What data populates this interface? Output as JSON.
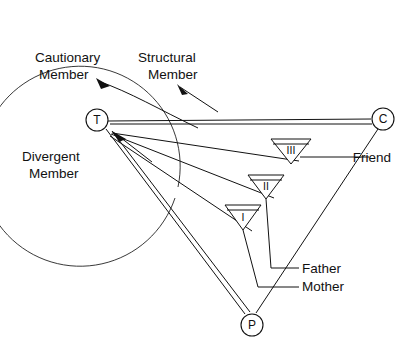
{
  "figure": {
    "type": "network-diagram",
    "background": "#ffffff",
    "line_color": "#111111",
    "width": 414,
    "height": 346
  },
  "nodes": [
    {
      "id": "T",
      "label": "T",
      "cx": 97,
      "cy": 120,
      "r": 11
    },
    {
      "id": "C",
      "label": "C",
      "cx": 383,
      "cy": 119,
      "r": 11
    },
    {
      "id": "P",
      "label": "P",
      "cx": 252,
      "cy": 325,
      "r": 11
    }
  ],
  "triangles": [
    {
      "id": "III",
      "label": "III",
      "cx": 291,
      "top": 139,
      "half_width": 20,
      "height": 25
    },
    {
      "id": "II",
      "label": "II",
      "cx": 266,
      "top": 175,
      "half_width": 18,
      "height": 24
    },
    {
      "id": "I",
      "label": "I",
      "cx": 243,
      "top": 205,
      "half_width": 18,
      "height": 24
    }
  ],
  "region_labels": [
    {
      "name": "cautionary-member",
      "line1": "Cautionary",
      "line2": "Member",
      "x": 35,
      "y": 62
    },
    {
      "name": "structural-member",
      "line1": "Structural",
      "line2": "Member",
      "x": 138,
      "y": 62
    },
    {
      "name": "divergent-member",
      "line1": "Divergent",
      "line2": "Member",
      "x": 22,
      "y": 161
    }
  ],
  "leader_labels": [
    {
      "name": "friend-label",
      "text": "Friend",
      "x": 372,
      "y": 158
    },
    {
      "name": "father-label",
      "text": "Father",
      "x": 302,
      "y": 269
    },
    {
      "name": "mother-label",
      "text": "Mother",
      "x": 302,
      "y": 287
    }
  ],
  "enclosure": {
    "name": "divergent-region-arc",
    "cx": 110,
    "cy": 117,
    "r": 100,
    "description": "large open circle arc enclosing Cautionary / Structural / Divergent member region"
  }
}
